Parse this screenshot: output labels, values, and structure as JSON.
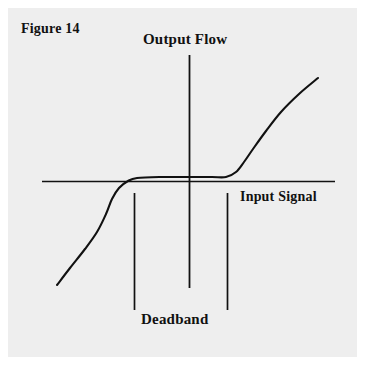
{
  "figure": {
    "caption": "Figure 14",
    "background_color": "#eeeeee",
    "page_color": "#ffffff",
    "ink_color": "#111111"
  },
  "labels": {
    "y_axis": "Output Flow",
    "x_axis": "Input Signal",
    "deadband": "Deadband"
  },
  "chart_data": {
    "type": "line",
    "title": "Figure 14",
    "xlabel": "Input Signal",
    "ylabel": "Output Flow",
    "legend": [],
    "grid": false,
    "annotations": [
      "Deadband"
    ],
    "axes": {
      "x_axis_y_px": 181,
      "x_axis_x_start_px": 42,
      "x_axis_x_end_px": 335,
      "y_axis_x_px": 189,
      "y_axis_y_start_px": 55,
      "y_axis_y_end_px": 288,
      "origin_px": [
        189,
        181
      ]
    },
    "deadband": {
      "left_marker_x_px": 134,
      "right_marker_x_px": 227,
      "marker_y_top_px": 193,
      "marker_y_bottom_px": 310,
      "label": "Deadband"
    },
    "series": [
      {
        "name": "Deadband transfer curve",
        "description": "S-shaped valve characteristic: linear negative branch, flat deadband plateau near zero input, linear positive branch",
        "points_px": [
          [
            57,
            285
          ],
          [
            70,
            268
          ],
          [
            85,
            249
          ],
          [
            97,
            232
          ],
          [
            106,
            214
          ],
          [
            112,
            199
          ],
          [
            119,
            188
          ],
          [
            128,
            181
          ],
          [
            137,
            178
          ],
          [
            160,
            177
          ],
          [
            189,
            177
          ],
          [
            212,
            177
          ],
          [
            226,
            177
          ],
          [
            236,
            172
          ],
          [
            244,
            162
          ],
          [
            253,
            149
          ],
          [
            266,
            131
          ],
          [
            281,
            112
          ],
          [
            299,
            94
          ],
          [
            318,
            78
          ]
        ],
        "normalized_points": [
          [
            -1.0,
            -0.95
          ],
          [
            -0.81,
            -0.83
          ],
          [
            -0.59,
            -0.68
          ],
          [
            -0.42,
            -0.54
          ],
          [
            -0.28,
            -0.4
          ],
          [
            -0.2,
            -0.27
          ],
          [
            -0.13,
            -0.17
          ],
          [
            -0.06,
            -0.05
          ],
          [
            -0.02,
            0.02
          ],
          [
            0.0,
            0.03
          ],
          [
            0.05,
            0.03
          ],
          [
            0.15,
            0.03
          ],
          [
            0.25,
            0.03
          ],
          [
            0.32,
            0.07
          ],
          [
            0.38,
            0.16
          ],
          [
            0.44,
            0.27
          ],
          [
            0.53,
            0.43
          ],
          [
            0.63,
            0.59
          ],
          [
            0.76,
            0.75
          ],
          [
            0.88,
            0.89
          ]
        ]
      }
    ],
    "xlim": [
      -1.0,
      1.0
    ],
    "ylim": [
      -1.0,
      1.0
    ]
  }
}
